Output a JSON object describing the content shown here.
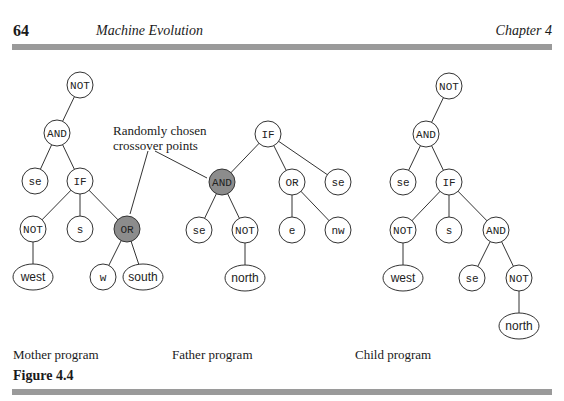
{
  "header": {
    "page_number": "64",
    "running_title": "Machine Evolution",
    "chapter": "Chapter 4"
  },
  "annotation": {
    "line1": "Randomly chosen",
    "line2": "crossover points"
  },
  "captions": {
    "mother": "Mother program",
    "father": "Father program",
    "child": "Child program"
  },
  "figure_label": "Figure 4.4",
  "colors": {
    "rule": "#9a9a9a",
    "highlight_node": "#8c8c8c",
    "node_fill": "#ffffff",
    "stroke": "#333333"
  },
  "trees": {
    "mother": {
      "nodes": [
        {
          "id": "m1",
          "label": "NOT",
          "x": 80,
          "y": 85
        },
        {
          "id": "m2",
          "label": "AND",
          "x": 57,
          "y": 133
        },
        {
          "id": "m3",
          "label": "se",
          "x": 35,
          "y": 181
        },
        {
          "id": "m4",
          "label": "IF",
          "x": 80,
          "y": 181
        },
        {
          "id": "m5",
          "label": "NOT",
          "x": 33,
          "y": 229
        },
        {
          "id": "m6",
          "label": "s",
          "x": 80,
          "y": 229
        },
        {
          "id": "m7",
          "label": "OR",
          "x": 127,
          "y": 229,
          "highlight": true
        },
        {
          "id": "m8",
          "label": "west",
          "x": 33,
          "y": 277,
          "shape": "ellipse"
        },
        {
          "id": "m9",
          "label": "w",
          "x": 103,
          "y": 277
        },
        {
          "id": "m10",
          "label": "south",
          "x": 143,
          "y": 277,
          "shape": "ellipse"
        }
      ]
    },
    "father": {
      "nodes": [
        {
          "id": "f1",
          "label": "IF",
          "x": 268,
          "y": 134
        },
        {
          "id": "f2",
          "label": "AND",
          "x": 222,
          "y": 182,
          "highlight": true
        },
        {
          "id": "f3",
          "label": "OR",
          "x": 292,
          "y": 182
        },
        {
          "id": "f4",
          "label": "se",
          "x": 338,
          "y": 182
        },
        {
          "id": "f5",
          "label": "se",
          "x": 199,
          "y": 230
        },
        {
          "id": "f6",
          "label": "NOT",
          "x": 245,
          "y": 230
        },
        {
          "id": "f7",
          "label": "e",
          "x": 292,
          "y": 230
        },
        {
          "id": "f8",
          "label": "nw",
          "x": 338,
          "y": 230
        },
        {
          "id": "f9",
          "label": "north",
          "x": 245,
          "y": 278,
          "shape": "ellipse"
        }
      ]
    },
    "child": {
      "nodes": [
        {
          "id": "c1",
          "label": "NOT",
          "x": 449,
          "y": 86
        },
        {
          "id": "c2",
          "label": "AND",
          "x": 426,
          "y": 134
        },
        {
          "id": "c3",
          "label": "se",
          "x": 403,
          "y": 182
        },
        {
          "id": "c4",
          "label": "IF",
          "x": 449,
          "y": 182
        },
        {
          "id": "c5",
          "label": "NOT",
          "x": 403,
          "y": 230
        },
        {
          "id": "c6",
          "label": "s",
          "x": 449,
          "y": 230
        },
        {
          "id": "c7",
          "label": "AND",
          "x": 496,
          "y": 230
        },
        {
          "id": "c8",
          "label": "west",
          "x": 403,
          "y": 278,
          "shape": "ellipse"
        },
        {
          "id": "c9",
          "label": "se",
          "x": 472,
          "y": 278
        },
        {
          "id": "c10",
          "label": "NOT",
          "x": 519,
          "y": 278
        },
        {
          "id": "c11",
          "label": "north",
          "x": 519,
          "y": 326,
          "shape": "ellipse"
        }
      ]
    }
  }
}
